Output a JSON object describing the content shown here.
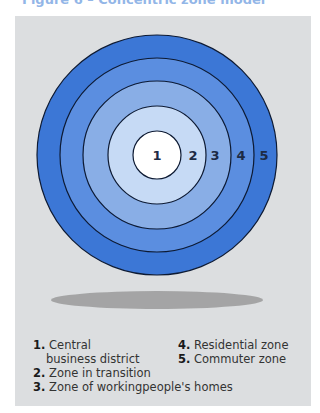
{
  "title": "Figure 6 – Concentric zone model",
  "colors": {
    "panel_bg": "#dcdee0",
    "zone1": "#ffffff",
    "zone2": "#c6daf5",
    "zone3": "#89aee6",
    "zone4": "#5b8ee0",
    "zone5": "#3c77d6",
    "ring_stroke": "#0d1a33",
    "shadow": "#9a9a9a"
  },
  "zones": [
    {
      "number": "1",
      "label": "Central business district"
    },
    {
      "number": "2",
      "label": "Zone in transition"
    },
    {
      "number": "3",
      "label": "Zone of workingpeople's homes"
    },
    {
      "number": "4",
      "label": "Residential zone"
    },
    {
      "number": "5",
      "label": "Commuter zone"
    }
  ],
  "legend": {
    "item1_num": "1.",
    "item1_line1": "Central",
    "item1_line2": "business district",
    "item2_num": "2.",
    "item2": "Zone in transition",
    "item3_num": "3.",
    "item3": "Zone of workingpeople's homes",
    "item4_num": "4.",
    "item4": "Residential zone",
    "item5_num": "5.",
    "item5": "Commuter zone"
  }
}
